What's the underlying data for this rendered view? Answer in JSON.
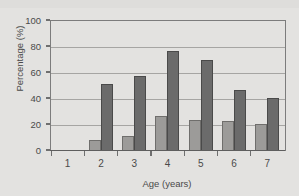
{
  "chart_data": {
    "type": "bar",
    "title": "",
    "xlabel": "Age (years)",
    "ylabel": "Percentage (%)",
    "categories": [
      "1",
      "2",
      "3",
      "4",
      "5",
      "6",
      "7"
    ],
    "series": [
      {
        "name": "series-light",
        "color": "#9c9b99",
        "values": [
          0,
          8,
          11,
          26,
          23,
          22,
          20
        ]
      },
      {
        "name": "series-dark",
        "color": "#6b6b6b",
        "values": [
          0,
          51,
          57,
          76,
          69,
          46,
          40
        ]
      }
    ],
    "ylim": [
      0,
      100
    ],
    "yticks": [
      0,
      20,
      40,
      60,
      80,
      100
    ],
    "ytick_labels": [
      "0",
      "20",
      "40",
      "60",
      "80",
      "100"
    ],
    "grid": true,
    "legend": "none",
    "plot_background": "#e3e2e0",
    "gridline_color": "#a6a5a3",
    "axis_color": "#6f6f6f",
    "text_color": "#4a4a4a"
  }
}
